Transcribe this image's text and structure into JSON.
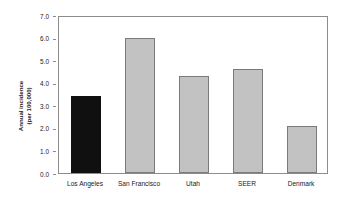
{
  "chart_data": {
    "type": "bar",
    "title": "",
    "xlabel": "",
    "ylabel": "Annual incidence (per 100,000)",
    "ylabel_lines": [
      "Annual incidence",
      "(per 100,000)"
    ],
    "categories": [
      "Los Angeles",
      "San Francisco",
      "Utah",
      "SEER",
      "Denmark"
    ],
    "values": [
      3.4,
      6.0,
      4.3,
      4.6,
      2.1
    ],
    "ylim": [
      0.0,
      7.0
    ],
    "ytick_step": 1.0,
    "yticks": [
      "0.0",
      "1.0",
      "2.0",
      "3.0",
      "4.0",
      "5.0",
      "6.0",
      "7.0"
    ],
    "ytick_values": [
      0.0,
      1.0,
      2.0,
      3.0,
      4.0,
      5.0,
      6.0,
      7.0
    ],
    "grid": false,
    "legend": "none",
    "bar_colors": [
      "#101010",
      "#c2c2c2",
      "#c2c2c2",
      "#c2c2c2",
      "#c2c2c2"
    ],
    "highlight_category": "Los Angeles",
    "colors": {
      "highlight_bar": "#101010",
      "default_bar": "#c2c2c2",
      "bar_outline": "#7a7a7a",
      "axis": "#8c8c8c",
      "text": "#1a1a1a",
      "background": "#ffffff"
    }
  }
}
